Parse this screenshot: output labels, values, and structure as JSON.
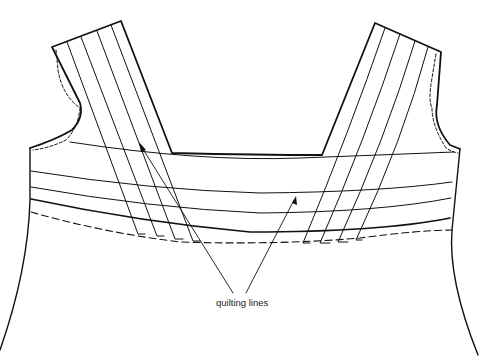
{
  "diagram": {
    "annotations": [
      {
        "text": "quilting lines",
        "arrows": 2
      }
    ],
    "colors": {
      "line": "#111111",
      "background": "#ffffff"
    }
  }
}
